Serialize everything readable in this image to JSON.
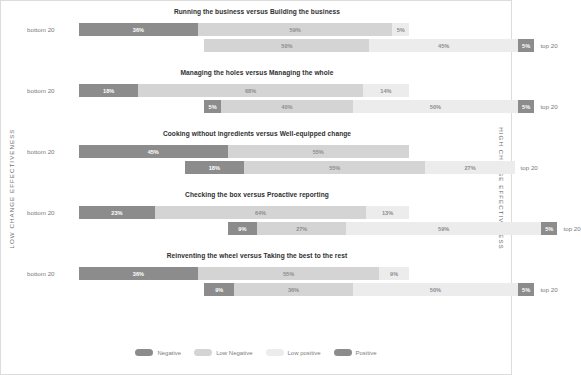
{
  "axes": {
    "left_label": "LOW CHANGE EFFECTIVENESS",
    "right_label": "HIGH CHANGE EFFECTIVENESS"
  },
  "row_labels": {
    "bottom": "bottom 20",
    "top": "top 20"
  },
  "legend": {
    "items": [
      {
        "label": "Negative",
        "color": "#8c8c8c"
      },
      {
        "label": "Low Negative",
        "color": "#d4d4d4"
      },
      {
        "label": "Low positive",
        "color": "#ececec"
      },
      {
        "label": "Positive",
        "color": "#8c8c8c"
      }
    ]
  },
  "colors": {
    "negative": "#8c8c8c",
    "low_negative": "#d4d4d4",
    "low_positive": "#ececec",
    "positive": "#8c8c8c",
    "title": "#2f2f2f",
    "axis_text": "#6d6d6d",
    "row_label": "#7a7a7a"
  },
  "chart_data": {
    "type": "bar",
    "orientation": "horizontal",
    "stacked": true,
    "title": "",
    "xlabel": "",
    "ylabel": "",
    "xlim": [
      0,
      100
    ],
    "grid": false,
    "legend_position": "bottom",
    "value_unit": "%",
    "series": [
      {
        "name": "Negative",
        "color": "#8c8c8c"
      },
      {
        "name": "Low Negative",
        "color": "#d4d4d4"
      },
      {
        "name": "Low positive",
        "color": "#ececec"
      },
      {
        "name": "Positive",
        "color": "#8c8c8c"
      }
    ],
    "groups": [
      {
        "title": "Running the business versus Building the business",
        "rows": [
          {
            "label": "bottom 20",
            "align": "left",
            "start_pct": 0,
            "segments": [
              {
                "series": "Negative",
                "value": 36,
                "label": "36%"
              },
              {
                "series": "Low Negative",
                "value": 59,
                "label": "59%"
              },
              {
                "series": "Low positive",
                "value": 5,
                "label": "5%"
              }
            ]
          },
          {
            "label": "top 20",
            "align": "right",
            "start_pct": 38,
            "segments": [
              {
                "series": "Low Negative",
                "value": 50,
                "label": "50%"
              },
              {
                "series": "Low positive",
                "value": 45,
                "label": "45%"
              },
              {
                "series": "Positive",
                "value": 5,
                "label": "5%"
              }
            ]
          }
        ]
      },
      {
        "title": "Managing the holes versus Managing the whole",
        "rows": [
          {
            "label": "bottom 20",
            "align": "left",
            "start_pct": 0,
            "segments": [
              {
                "series": "Negative",
                "value": 18,
                "label": "18%"
              },
              {
                "series": "Low Negative",
                "value": 68,
                "label": "68%"
              },
              {
                "series": "Low positive",
                "value": 14,
                "label": "14%"
              }
            ]
          },
          {
            "label": "top 20",
            "align": "right",
            "start_pct": 38,
            "segments": [
              {
                "series": "Negative",
                "value": 5,
                "label": "5%"
              },
              {
                "series": "Low Negative",
                "value": 40,
                "label": "40%"
              },
              {
                "series": "Low positive",
                "value": 50,
                "label": "50%"
              },
              {
                "series": "Positive",
                "value": 5,
                "label": "5%"
              }
            ]
          }
        ]
      },
      {
        "title": "Cooking without ingredients versus Well-equipped change",
        "rows": [
          {
            "label": "bottom 20",
            "align": "left",
            "start_pct": 0,
            "segments": [
              {
                "series": "Negative",
                "value": 45,
                "label": "45%"
              },
              {
                "series": "Low Negative",
                "value": 55,
                "label": "55%"
              }
            ]
          },
          {
            "label": "top 20",
            "align": "right",
            "start_pct": 32,
            "segments": [
              {
                "series": "Negative",
                "value": 18,
                "label": "18%"
              },
              {
                "series": "Low Negative",
                "value": 55,
                "label": "55%"
              },
              {
                "series": "Low positive",
                "value": 27,
                "label": "27%"
              }
            ]
          }
        ]
      },
      {
        "title": "Checking the box versus Proactive reporting",
        "rows": [
          {
            "label": "bottom 20",
            "align": "left",
            "start_pct": 0,
            "segments": [
              {
                "series": "Negative",
                "value": 23,
                "label": "23%"
              },
              {
                "series": "Low Negative",
                "value": 64,
                "label": "64%"
              },
              {
                "series": "Low positive",
                "value": 13,
                "label": "13%"
              }
            ]
          },
          {
            "label": "top 20",
            "align": "right",
            "start_pct": 45,
            "segments": [
              {
                "series": "Negative",
                "value": 9,
                "label": "9%"
              },
              {
                "series": "Low Negative",
                "value": 27,
                "label": "27%"
              },
              {
                "series": "Low positive",
                "value": 59,
                "label": "59%"
              },
              {
                "series": "Positive",
                "value": 5,
                "label": "5%"
              }
            ]
          }
        ]
      },
      {
        "title": "Reinventing the wheel versus Taking the best to the rest",
        "rows": [
          {
            "label": "bottom 20",
            "align": "left",
            "start_pct": 0,
            "segments": [
              {
                "series": "Negative",
                "value": 36,
                "label": "36%"
              },
              {
                "series": "Low Negative",
                "value": 55,
                "label": "55%"
              },
              {
                "series": "Low positive",
                "value": 9,
                "label": "9%"
              }
            ]
          },
          {
            "label": "top 20",
            "align": "right",
            "start_pct": 38,
            "segments": [
              {
                "series": "Negative",
                "value": 9,
                "label": "9%"
              },
              {
                "series": "Low Negative",
                "value": 36,
                "label": "36%"
              },
              {
                "series": "Low positive",
                "value": 50,
                "label": "50%"
              },
              {
                "series": "Positive",
                "value": 5,
                "label": "5%"
              }
            ]
          }
        ]
      }
    ]
  }
}
